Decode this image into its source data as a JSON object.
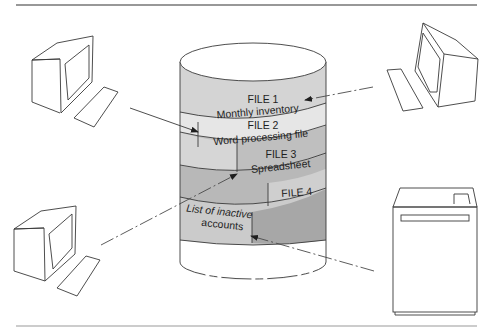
{
  "diagram": {
    "type": "shared-database",
    "colors": {
      "ink": "#3a3a3a",
      "band_light": "#d6d6d6",
      "band_lighter": "#e4e4e4",
      "band_mid": "#bdbdbd",
      "band_dark": "#a9a9a9",
      "background": "#ffffff"
    },
    "database": {
      "name": "shared-storage-cylinder",
      "files": [
        {
          "id": "file1",
          "title": "FILE 1",
          "subtitle": "Monthly inventory"
        },
        {
          "id": "file2",
          "title": "FILE 2",
          "subtitle": "Word processing file"
        },
        {
          "id": "file3",
          "title": "FILE 3",
          "subtitle": "Spreadsheet"
        },
        {
          "id": "file4",
          "title": "FILE 4",
          "subtitle_line1": "List of inactive",
          "subtitle_line2": "accounts"
        }
      ]
    },
    "devices": [
      {
        "id": "terminal-top-left",
        "kind": "terminal",
        "connects_to": "file2"
      },
      {
        "id": "terminal-top-right",
        "kind": "terminal",
        "connects_to": "file1"
      },
      {
        "id": "terminal-bottom-left",
        "kind": "terminal",
        "connects_to": "file3"
      },
      {
        "id": "printer-bottom-right",
        "kind": "printer",
        "connects_to": "file4"
      }
    ]
  }
}
